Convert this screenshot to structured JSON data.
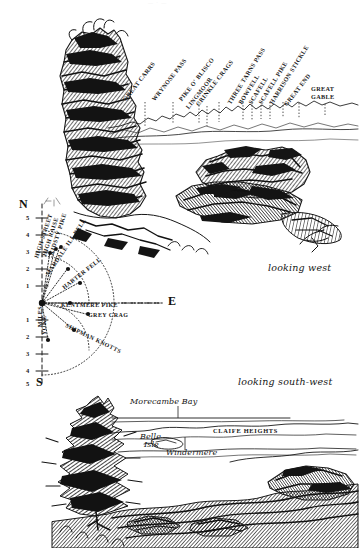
{
  "page": {
    "background_color": "#ffffff",
    "ink_color": "#191919",
    "top_fragment": "— · —"
  },
  "upper_panorama": {
    "caption": "looking west",
    "skyline_labels": [
      {
        "text": "GREAT CARRS",
        "x": 127,
        "y": 96,
        "angle": -52,
        "tick_x": 145,
        "tick_y": 100,
        "tick_len": 18
      },
      {
        "text": "WRYNOSE PASS",
        "x": 156,
        "y": 96,
        "angle": -52,
        "tick_x": 173,
        "tick_y": 100,
        "tick_len": 18
      },
      {
        "text": "PIKE O' BLISCO",
        "x": 183,
        "y": 96,
        "angle": -52,
        "tick_x": 199,
        "tick_y": 100,
        "tick_len": 18
      },
      {
        "text": "LINGMOOR",
        "x": 190,
        "y": 103,
        "angle": -52,
        "tick_x": 207,
        "tick_y": 103,
        "tick_len": 15
      },
      {
        "text": "CRINKLE CRAGS",
        "x": 199,
        "y": 101,
        "angle": -52,
        "tick_x": 219,
        "tick_y": 100,
        "tick_len": 18
      },
      {
        "text": "THREE TARNS PASS",
        "x": 232,
        "y": 99,
        "angle": -58,
        "tick_x": 243,
        "tick_y": 100,
        "tick_len": 18
      },
      {
        "text": "BOWFELL",
        "x": 243,
        "y": 99,
        "angle": -58,
        "tick_x": 252,
        "tick_y": 100,
        "tick_len": 18
      },
      {
        "text": "SCAFELL",
        "x": 253,
        "y": 99,
        "angle": -58,
        "tick_x": 261,
        "tick_y": 100,
        "tick_len": 18
      },
      {
        "text": "SCAFELL PIKE",
        "x": 263,
        "y": 99,
        "angle": -58,
        "tick_x": 272,
        "tick_y": 100,
        "tick_len": 18
      },
      {
        "text": "HARRISON STICKLE",
        "x": 274,
        "y": 99,
        "angle": -58,
        "tick_x": 285,
        "tick_y": 100,
        "tick_len": 18
      },
      {
        "text": "GREAT END",
        "x": 287,
        "y": 101,
        "angle": -52,
        "tick_x": 300,
        "tick_y": 101,
        "tick_len": 16
      }
    ],
    "flat_labels": [
      {
        "line1": "GREAT",
        "line2": "GABLE",
        "x": 311,
        "y": 88,
        "tick_x": 325,
        "tick_y": 104,
        "tick_len": 11
      }
    ]
  },
  "ridge_diagram": {
    "cardinals": [
      {
        "label": "N",
        "x": 21,
        "y": 203
      },
      {
        "label": "E",
        "x": 170,
        "y": 296
      },
      {
        "label": "S",
        "x": 29,
        "y": 383
      }
    ],
    "scale_word": "MILES",
    "scale_numbers_up": [
      "5",
      "4",
      "3",
      "2",
      "1"
    ],
    "scale_numbers_down": [
      "1",
      "2",
      "3",
      "4",
      "5"
    ],
    "fell_labels": [
      {
        "text": "HIGH STREET",
        "x": 36,
        "y": 255,
        "angle": -72
      },
      {
        "text": "HIGH RAISE",
        "x": 44,
        "y": 253,
        "angle": -72
      },
      {
        "text": "KIDSTY PIKE",
        "x": 51,
        "y": 252,
        "angle": -72
      },
      {
        "text": "MARDALE ILL BELL",
        "x": 47,
        "y": 272,
        "angle": -56
      },
      {
        "text": "HARTER FELL",
        "x": 63,
        "y": 285,
        "angle": -38
      },
      {
        "text": "KENTMERE PIKE",
        "x": 61,
        "y": 303,
        "angle": 0
      },
      {
        "text": "GREY CRAG",
        "x": 88,
        "y": 313,
        "angle": 0
      },
      {
        "text": "SHIPMAN KNOTTS",
        "x": 66,
        "y": 322,
        "angle": 26
      },
      {
        "text": "YOKE",
        "x": 44,
        "y": 330,
        "angle": -90
      }
    ]
  },
  "lower_panorama": {
    "caption": "looking south-west",
    "labels": [
      {
        "text": "Morecambe Bay",
        "x": 130,
        "y": 400,
        "style": "italic",
        "tick_x": 178,
        "tick_y": 410,
        "tick_len": 6
      },
      {
        "text": "CLAIFE HEIGHTS",
        "x": 213,
        "y": 429,
        "style": "caps",
        "tick_x": 0,
        "tick_y": 0,
        "tick_len": 0
      },
      {
        "text": "Belle",
        "x": 142,
        "y": 435,
        "style": "italic",
        "tick_x": 0,
        "tick_y": 0,
        "tick_len": 0
      },
      {
        "text": "Isle",
        "x": 146,
        "y": 443,
        "style": "italic",
        "tick_x": 0,
        "tick_y": 0,
        "tick_len": 0
      },
      {
        "text": "Windermere",
        "x": 170,
        "y": 450,
        "style": "italic",
        "tick_x": 185,
        "tick_y": 443,
        "tick_len": 7
      }
    ]
  }
}
